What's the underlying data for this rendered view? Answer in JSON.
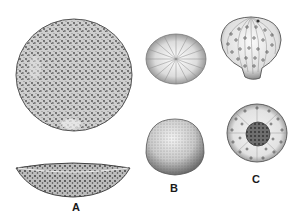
{
  "illustration": {
    "background": "#ffffff",
    "ink_color": "#2a2a2a",
    "panels": [
      {
        "id": "A",
        "label": "A",
        "views": [
          "top-view-disc",
          "side-view-shallow-dish"
        ]
      },
      {
        "id": "B",
        "label": "B",
        "views": [
          "top-view-radial-striated",
          "side-view-dome-stippled"
        ]
      },
      {
        "id": "C",
        "label": "C",
        "views": [
          "side-view-ribbed-globular-with-pores",
          "top-view-central-disc-with-pores"
        ]
      }
    ]
  }
}
